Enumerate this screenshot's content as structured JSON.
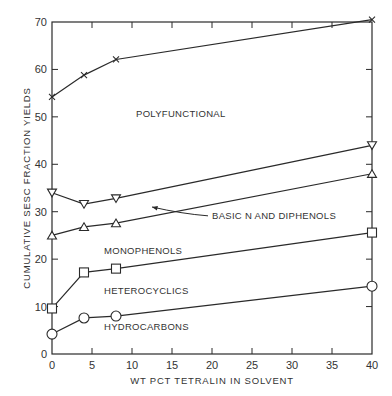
{
  "chart_data": {
    "type": "line",
    "title": "",
    "xlabel": "WT PCT TETRALIN IN SOLVENT",
    "ylabel": "CUMULATIVE SESC FRACTION YIELDS",
    "xlim": [
      0,
      40
    ],
    "ylim": [
      0,
      70
    ],
    "xticks": [
      0,
      5,
      10,
      15,
      20,
      25,
      30,
      35,
      40
    ],
    "yticks": [
      0,
      10,
      20,
      30,
      40,
      50,
      60,
      70
    ],
    "grid": false,
    "legend": "inline labels",
    "x": [
      0,
      4,
      8,
      40
    ],
    "series": [
      {
        "name": "Polyfunctional",
        "marker": "x",
        "values": [
          54.2,
          58.8,
          62.1,
          70.5
        ]
      },
      {
        "name": "Basic N and Diphenols",
        "marker": "triangle-down",
        "values": [
          34.0,
          31.6,
          32.8,
          44.0
        ]
      },
      {
        "name": "Monophenols",
        "marker": "triangle-up",
        "values": [
          25.0,
          26.8,
          27.6,
          38.0
        ]
      },
      {
        "name": "Heterocyclics",
        "marker": "square",
        "values": [
          9.6,
          17.2,
          18.0,
          25.6
        ]
      },
      {
        "name": "Hydrocarbons",
        "marker": "circle",
        "values": [
          4.2,
          7.6,
          8.0,
          14.3
        ]
      }
    ],
    "annotations": [
      {
        "text": "POLYFUNCTIONAL",
        "x": 10.5,
        "y": 50
      },
      {
        "text": "BASIC N AND DIPHENOLS",
        "x": 20,
        "y": 28.5,
        "arrow_to": [
          12.5,
          31
        ]
      },
      {
        "text": "MONOPHENOLS",
        "x": 6.5,
        "y": 21
      },
      {
        "text": "HETEROCYCLICS",
        "x": 6.5,
        "y": 12.7
      },
      {
        "text": "HYDROCARBONS",
        "x": 6.5,
        "y": 5
      }
    ]
  },
  "labels": {
    "x_axis": "WT PCT TETRALIN IN SOLVENT",
    "y_axis": "CUMULATIVE SESC FRACTION YIELDS",
    "polyfunctional": "POLYFUNCTIONAL",
    "basic_n": "BASIC N AND DIPHENOLS",
    "monophenols": "MONOPHENOLS",
    "heterocyclics": "HETEROCYCLICS",
    "hydrocarbons": "HYDROCARBONS"
  }
}
